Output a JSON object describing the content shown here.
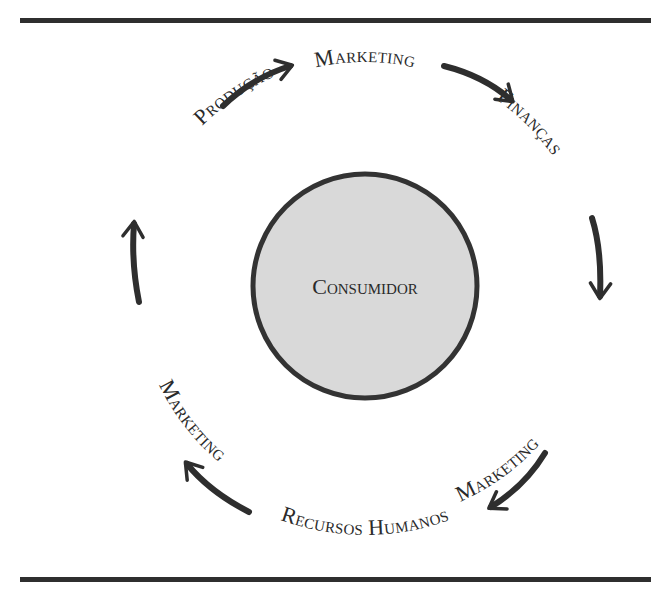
{
  "diagram": {
    "type": "cycle",
    "center": {
      "label": "Consumidor",
      "fill": "#d9d9d9",
      "stroke": "#333333"
    },
    "cycle_nodes": [
      {
        "id": "marketing-top",
        "label": "Marketing"
      },
      {
        "id": "financas",
        "label": "Finanças"
      },
      {
        "id": "marketing-right",
        "label": "Marketing"
      },
      {
        "id": "recursos-humanos",
        "label": "Recursos Humanos"
      },
      {
        "id": "marketing-left",
        "label": "Marketing"
      },
      {
        "id": "producao",
        "label": "Produção"
      }
    ],
    "edges": [
      {
        "from": "marketing-top",
        "to": "financas"
      },
      {
        "from": "financas",
        "to": "marketing-right"
      },
      {
        "from": "marketing-right",
        "to": "recursos-humanos"
      },
      {
        "from": "recursos-humanos",
        "to": "marketing-left"
      },
      {
        "from": "marketing-left",
        "to": "producao"
      },
      {
        "from": "producao",
        "to": "marketing-top"
      }
    ],
    "direction": "clockwise"
  }
}
